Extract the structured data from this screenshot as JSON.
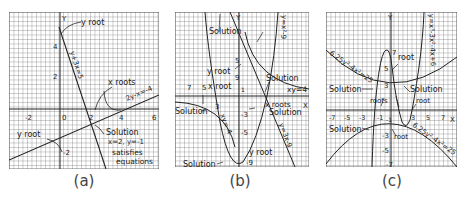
{
  "figure": {
    "panels": [
      {
        "id": "a",
        "caption": "(a)",
        "axis_labels": {
          "y": "Y"
        },
        "x_ticks": [
          "-2",
          "0",
          "2",
          "4",
          "6"
        ],
        "y_ticks": [
          "4",
          "2",
          "-2"
        ],
        "curves": [
          {
            "label": "y+3x=5",
            "type": "line"
          },
          {
            "label": "2y-x=-4",
            "type": "line"
          }
        ],
        "annotations": {
          "y_root_top": "y root",
          "y_root_bottom": "y root",
          "x_roots": "x roots",
          "solution": "Solution",
          "solution_values": "x=2, y=-1",
          "satisfies": "satisfies",
          "equations": "equations"
        }
      },
      {
        "id": "b",
        "caption": "(b)",
        "axis_labels": {
          "y": "Y",
          "x": "X"
        },
        "x_ticks": [
          "7",
          "5",
          "3"
        ],
        "y_ticks": [
          "5",
          "9",
          "1",
          "3",
          "-3",
          "-5",
          "-9"
        ],
        "curves": [
          {
            "label": "y=x²-9",
            "type": "parabola"
          },
          {
            "label": "xy=4",
            "type": "hyperbola"
          },
          {
            "label": "xy=-4",
            "type": "hyperbola"
          },
          {
            "label": "y=3x-9",
            "type": "line"
          }
        ],
        "annotations": {
          "solution_top": "Solution",
          "y_root_top": "y root",
          "x_root": "x root",
          "solution_left": "Solution",
          "solution_right_top": "Solution",
          "x_roots": "x roots",
          "solution_right": "Solution",
          "y_root_bottom": "y root",
          "solution_bottom": "Solution"
        }
      },
      {
        "id": "c",
        "caption": "(c)",
        "axis_labels": {
          "y": "Y",
          "x": "X"
        },
        "x_ticks": [
          "-7",
          "-5",
          "-3",
          "-1",
          "3",
          "5",
          "7"
        ],
        "y_ticks": [
          "7",
          "5",
          "3",
          "-1",
          "-3",
          "-5",
          "-7"
        ],
        "curves": [
          {
            "label": "y=x³-3x²-4x+6",
            "type": "cubic"
          },
          {
            "label": "6.25y²-4x²=25",
            "type": "hyperbola"
          },
          {
            "label": "6.25y²-4x²=25",
            "type": "hyperbola"
          }
        ],
        "annotations": {
          "root_top": "root",
          "solution_left_top": "Solution",
          "solution_right_top": "Solution",
          "roots": "roots",
          "root_right": "root",
          "solution_left_bottom": "Solution",
          "root_bottom": "root"
        }
      }
    ]
  }
}
